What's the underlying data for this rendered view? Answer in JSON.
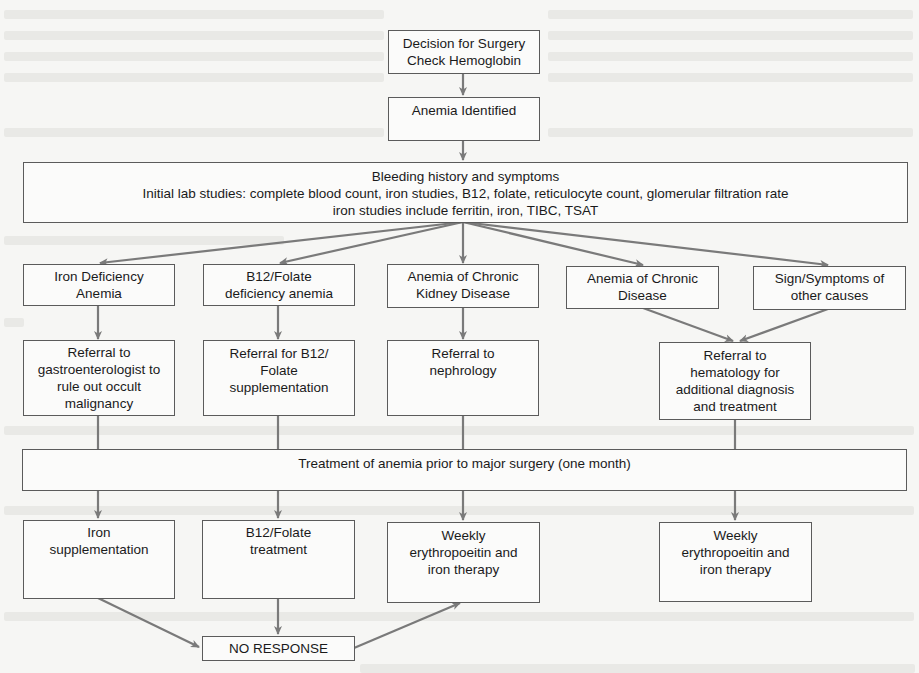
{
  "diagram": {
    "type": "flowchart",
    "colors": {
      "box_border": "#5b5b5b",
      "box_fill": "#fbfbfa",
      "arrow": "#7a7a7a",
      "background": "#f6f6f4",
      "text": "#1a1a1a"
    },
    "nodes": {
      "decision": {
        "lines": [
          "Decision for Surgery",
          "Check Hemoglobin"
        ]
      },
      "anemia_identified": {
        "lines": [
          "Anemia Identified"
        ]
      },
      "workup": {
        "lines": [
          "Bleeding history and symptoms",
          "Initial lab studies: complete blood count, iron studies, B12, folate, reticulocyte count, glomerular filtration rate",
          "iron studies include ferritin, iron, TIBC, TSAT"
        ]
      },
      "iron_deficiency": {
        "lines": [
          "Iron Deficiency",
          "Anemia"
        ]
      },
      "b12_folate_deficiency": {
        "lines": [
          "B12/Folate",
          "deficiency anemia"
        ]
      },
      "ckd_anemia": {
        "lines": [
          "Anemia of Chronic",
          "Kidney Disease"
        ]
      },
      "chronic_disease_anemia": {
        "lines": [
          "Anemia of Chronic",
          "Disease"
        ]
      },
      "other_causes": {
        "lines": [
          "Sign/Symptoms of",
          "other causes"
        ]
      },
      "referral_gi": {
        "lines": [
          "Referral to",
          "gastroenterologist to",
          "rule out occult",
          "malignancy"
        ]
      },
      "referral_b12": {
        "lines": [
          "Referral for B12/",
          "Folate",
          "supplementation"
        ]
      },
      "referral_nephrology": {
        "lines": [
          "Referral to",
          "nephrology"
        ]
      },
      "referral_hematology": {
        "lines": [
          "Referral to",
          "hematology for",
          "additional diagnosis",
          "and treatment"
        ]
      },
      "treatment": {
        "lines": [
          "Treatment of anemia prior to major surgery (one month)"
        ]
      },
      "iron_supplementation": {
        "lines": [
          "Iron",
          "supplementation"
        ]
      },
      "b12_folate_treatment": {
        "lines": [
          "B12/Folate",
          "treatment"
        ]
      },
      "epo_iron_left": {
        "lines": [
          "Weekly",
          "erythropoeitin and",
          "iron therapy"
        ]
      },
      "epo_iron_right": {
        "lines": [
          "Weekly",
          "erythropoeitin and",
          "iron therapy"
        ]
      },
      "no_response": {
        "lines": [
          "NO RESPONSE"
        ]
      }
    },
    "edges": [
      {
        "from": "decision",
        "to": "anemia_identified",
        "arrow": true
      },
      {
        "from": "anemia_identified",
        "to": "workup",
        "arrow": true
      },
      {
        "from": "workup",
        "to": "iron_deficiency",
        "arrow": true
      },
      {
        "from": "workup",
        "to": "b12_folate_deficiency",
        "arrow": true
      },
      {
        "from": "workup",
        "to": "ckd_anemia",
        "arrow": true
      },
      {
        "from": "workup",
        "to": "chronic_disease_anemia",
        "arrow": true
      },
      {
        "from": "workup",
        "to": "other_causes",
        "arrow": true
      },
      {
        "from": "iron_deficiency",
        "to": "referral_gi",
        "arrow": true
      },
      {
        "from": "b12_folate_deficiency",
        "to": "referral_b12",
        "arrow": true
      },
      {
        "from": "ckd_anemia",
        "to": "referral_nephrology",
        "arrow": true
      },
      {
        "from": "chronic_disease_anemia",
        "to": "referral_hematology",
        "arrow": true
      },
      {
        "from": "other_causes",
        "to": "referral_hematology",
        "arrow": true
      },
      {
        "from": "referral_gi",
        "to": "treatment",
        "arrow": false
      },
      {
        "from": "referral_b12",
        "to": "treatment",
        "arrow": false
      },
      {
        "from": "referral_nephrology",
        "to": "treatment",
        "arrow": false
      },
      {
        "from": "referral_hematology",
        "to": "treatment",
        "arrow": false
      },
      {
        "from": "treatment",
        "to": "iron_supplementation",
        "arrow": true
      },
      {
        "from": "treatment",
        "to": "b12_folate_treatment",
        "arrow": true
      },
      {
        "from": "treatment",
        "to": "epo_iron_left",
        "arrow": true
      },
      {
        "from": "treatment",
        "to": "epo_iron_right",
        "arrow": true
      },
      {
        "from": "iron_supplementation",
        "to": "no_response",
        "arrow": true
      },
      {
        "from": "b12_folate_treatment",
        "to": "no_response",
        "arrow": true
      },
      {
        "from": "no_response",
        "to": "epo_iron_left",
        "arrow": true
      }
    ]
  }
}
